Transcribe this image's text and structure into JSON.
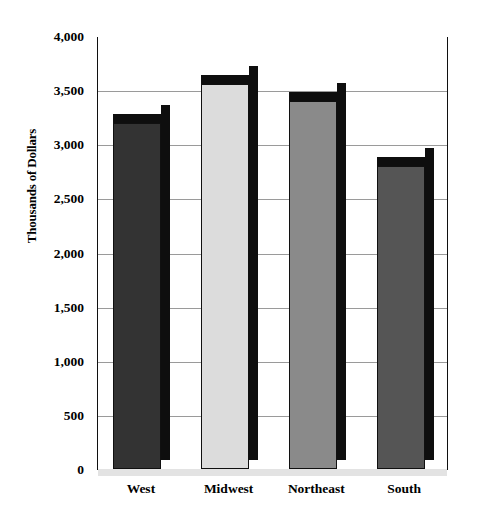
{
  "chart_data": {
    "type": "bar",
    "title": "",
    "subtitle": "",
    "xlabel": "",
    "ylabel": "Thousands of Dollars",
    "categories": [
      "West",
      "Midwest",
      "Northeast",
      "South"
    ],
    "values": [
      3200,
      3560,
      3400,
      2800
    ],
    "series": [
      {
        "name": "Thousands of Dollars",
        "values": [
          3200,
          3560,
          3400,
          2800
        ]
      }
    ],
    "ylim": [
      0,
      4000
    ],
    "ytick_values": [
      0,
      500,
      1000,
      1500,
      2000,
      2500,
      3000,
      3500,
      4000
    ],
    "ytick_labels": [
      "0",
      "500",
      "1,000",
      "1,500",
      "2,000",
      "2,500",
      "3,000",
      "3,500",
      "4,000"
    ],
    "grid": true,
    "legend": false,
    "legend_position": "none",
    "style": "3d-column",
    "bar_colors": [
      "#333333",
      "#dcdcdc",
      "#8a8a8a",
      "#555555"
    ],
    "bar_edge_color": "#101010",
    "bar_side_color": "#0e0e0e",
    "gridline_color": "#9a9a9a",
    "plot_border_color": "#101010",
    "background_color": "#ffffff",
    "text_color": "#000000"
  }
}
